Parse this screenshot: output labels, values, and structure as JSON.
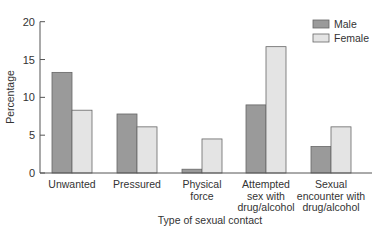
{
  "chart_data": {
    "type": "bar",
    "title": "",
    "xlabel": "Type of sexual contact",
    "ylabel": "Percentage",
    "ylim": [
      0,
      20
    ],
    "yticks": [
      0,
      5,
      10,
      15,
      20
    ],
    "grid": false,
    "legend_position": "top-right",
    "categories": [
      [
        "Unwanted"
      ],
      [
        "Pressured"
      ],
      [
        "Physical",
        "force"
      ],
      [
        "Attempted",
        "sex with",
        "drug/alcohol"
      ],
      [
        "Sexual",
        "encounter with",
        "drug/alcohol"
      ]
    ],
    "series": [
      {
        "name": "Male",
        "color": "#9a9a9a",
        "values": [
          13.3,
          7.8,
          0.5,
          9.0,
          3.5
        ]
      },
      {
        "name": "Female",
        "color": "#e4e4e4",
        "values": [
          8.3,
          6.1,
          4.5,
          16.7,
          6.1
        ]
      }
    ]
  }
}
